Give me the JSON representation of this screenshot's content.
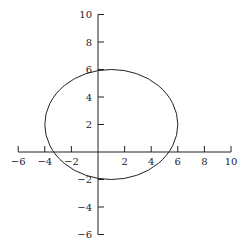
{
  "chart_data": {
    "type": "line",
    "title": "",
    "xlabel": "",
    "ylabel": "",
    "xlim": [
      -6,
      10
    ],
    "ylim": [
      -6,
      10
    ],
    "grid": false,
    "x_ticks": [
      -6,
      -4,
      -2,
      2,
      4,
      6,
      8,
      10
    ],
    "y_ticks": [
      10,
      8,
      6,
      4,
      2,
      -2,
      -4,
      -6
    ],
    "x_tick_labels": [
      "−6",
      "−4",
      "−2",
      "2",
      "4",
      "6",
      "8",
      "10"
    ],
    "y_tick_labels": [
      "10",
      "8",
      "6",
      "4",
      "2",
      "−2",
      "−4",
      "−6"
    ],
    "series": [
      {
        "name": "ellipse",
        "shape": "ellipse",
        "center": [
          1,
          2
        ],
        "rx": 5,
        "ry": 4,
        "equation": "(x-1)^2/25 + (y-2)^2/16 = 1",
        "color": "#222222"
      }
    ]
  },
  "style": {
    "axis_color": "#222222",
    "curve_color": "#222222"
  }
}
